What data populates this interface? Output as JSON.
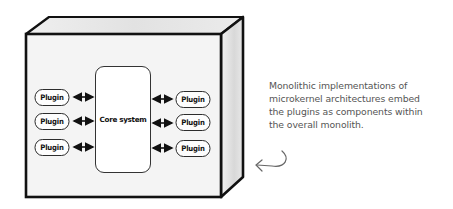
{
  "diagram": {
    "container": {
      "type": "3d-box",
      "label": "monolith"
    },
    "core": {
      "label": "Core system"
    },
    "plugins_left": [
      {
        "label": "Plugin"
      },
      {
        "label": "Plugin"
      },
      {
        "label": "Plugin"
      }
    ],
    "plugins_right": [
      {
        "label": "Plugin"
      },
      {
        "label": "Plugin"
      },
      {
        "label": "Plugin"
      }
    ],
    "connections": "bidirectional arrows between each plugin and the core system",
    "annotation": {
      "lines": [
        "Monolithic implementations of",
        "microkernel architectures embed",
        "the plugins as components within",
        "the overall monolith."
      ],
      "pointer": "curved-arrow-left"
    },
    "colors": {
      "outline": "#111111",
      "face_fill": "#f4f4f4",
      "top_fill": "#e6e6e6",
      "side_fill": "#dedede",
      "annotation_text": "#555555"
    }
  }
}
